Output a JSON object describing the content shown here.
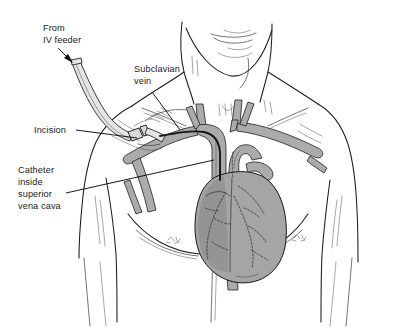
{
  "figure": {
    "background_color": "#ffffff",
    "line_color": "#1c1c1c",
    "vessel_color": "#ababab",
    "heart_color": "#a5a5a5",
    "tube_color": "#e4e4e4"
  },
  "labels": {
    "iv_feeder": {
      "line1": "From",
      "line2": "IV feeder"
    },
    "subclavian": {
      "line1": "Subclavian",
      "line2": "vein"
    },
    "incision": {
      "line1": "Incision"
    },
    "catheter": {
      "line1": "Catheter",
      "line2": "inside",
      "line3": "superior",
      "line4": "vena cava"
    }
  }
}
